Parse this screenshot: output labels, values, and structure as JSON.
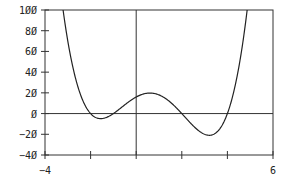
{
  "chart_data": {
    "type": "line",
    "title": "",
    "xlabel": "",
    "ylabel": "",
    "xlim": [
      -4,
      6
    ],
    "ylim": [
      -40,
      100
    ],
    "grid": false,
    "legend": null,
    "function": "f(x) = (x+2)(x+1)(x-2)(x-4)",
    "x_tick_labels": [
      "-4",
      "6"
    ],
    "x_ticks": [
      -4,
      -2,
      0,
      2,
      4,
      6
    ],
    "y_tick_labels": [
      "100",
      "80",
      "60",
      "40",
      "20",
      "0",
      "-20",
      "-40"
    ],
    "y_ticks": [
      100,
      80,
      60,
      40,
      20,
      0,
      -20,
      -40
    ],
    "series": [
      {
        "name": "f(x)",
        "x": [
          -3.2,
          -3.0,
          -2.5,
          -2.0,
          -1.5,
          -1.0,
          -0.5,
          0.0,
          0.5,
          1.0,
          1.5,
          2.0,
          2.5,
          3.0,
          3.5,
          4.0,
          4.5,
          4.87
        ],
        "y": [
          100,
          70,
          23.6,
          0,
          -4.8,
          0,
          9.6,
          16,
          18.6,
          18,
          15.2,
          0,
          -7.3,
          -15,
          -18.6,
          0,
          33.9,
          100
        ]
      }
    ],
    "key_points": {
      "roots": [
        -2,
        -1,
        2,
        4
      ],
      "local_min_1": [
        -1.5,
        -4.8
      ],
      "local_max": [
        0.7,
        19.7
      ],
      "local_min_2": [
        3.4,
        -18.9
      ]
    },
    "line_color": "#222222",
    "axis_color": "#333333"
  }
}
